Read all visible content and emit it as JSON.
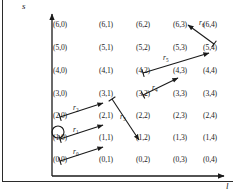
{
  "figure": {
    "name": "state-lattice-transition-diagram",
    "background": "#ffffff",
    "ink": "#1a1a1a",
    "width": 235,
    "height": 196
  },
  "axes": {
    "y_label": "s",
    "x_label": "l",
    "y_axis": {
      "x": 52,
      "y_top": 14,
      "y_bottom": 176,
      "arrow": "up"
    },
    "x_axis": {
      "y": 176,
      "x_left": 52,
      "x_right": 224,
      "arrow": "right"
    }
  },
  "chart_data": {
    "type": "scatter",
    "title": "",
    "xlabel": "l",
    "ylabel": "s",
    "grid": false,
    "legend": "none",
    "x_values": [
      0,
      1,
      2,
      3,
      4
    ],
    "y_values": [
      0,
      1,
      2,
      3,
      4,
      5,
      6
    ],
    "column_x_px": [
      62,
      108,
      145,
      182,
      212
    ],
    "row_y_px": [
      160,
      138,
      116,
      94,
      71,
      48,
      25
    ],
    "nodes": [
      {
        "s": 6,
        "l": 0,
        "label": "(6,0)"
      },
      {
        "s": 6,
        "l": 1,
        "label": "(6,1)"
      },
      {
        "s": 6,
        "l": 2,
        "label": "(6,2)"
      },
      {
        "s": 6,
        "l": 3,
        "label": "(6,3)"
      },
      {
        "s": 6,
        "l": 4,
        "label": "(6,4)"
      },
      {
        "s": 5,
        "l": 0,
        "label": "(5,0)"
      },
      {
        "s": 5,
        "l": 1,
        "label": "(5,1)"
      },
      {
        "s": 5,
        "l": 2,
        "label": "(5,2)"
      },
      {
        "s": 5,
        "l": 3,
        "label": "(5,3)"
      },
      {
        "s": 5,
        "l": 4,
        "label": "(5,4)"
      },
      {
        "s": 4,
        "l": 0,
        "label": "(4,0)"
      },
      {
        "s": 4,
        "l": 1,
        "label": "(4,1)"
      },
      {
        "s": 4,
        "l": 2,
        "label": "(4,2)"
      },
      {
        "s": 4,
        "l": 3,
        "label": "(4,3)"
      },
      {
        "s": 4,
        "l": 4,
        "label": "(4,4)"
      },
      {
        "s": 3,
        "l": 0,
        "label": "(3,0)"
      },
      {
        "s": 3,
        "l": 1,
        "label": "(3,1)"
      },
      {
        "s": 3,
        "l": 2,
        "label": "(3,2)"
      },
      {
        "s": 3,
        "l": 3,
        "label": "(3,3)"
      },
      {
        "s": 3,
        "l": 4,
        "label": "(3,4)"
      },
      {
        "s": 2,
        "l": 0,
        "label": "(2,0)"
      },
      {
        "s": 2,
        "l": 1,
        "label": "(2,1)"
      },
      {
        "s": 2,
        "l": 2,
        "label": "(2,2)"
      },
      {
        "s": 2,
        "l": 3,
        "label": "(2,3)"
      },
      {
        "s": 2,
        "l": 4,
        "label": "(2,4)"
      },
      {
        "s": 1,
        "l": 0,
        "label": "(1,0)"
      },
      {
        "s": 1,
        "l": 1,
        "label": "(1,1)"
      },
      {
        "s": 1,
        "l": 2,
        "label": "(1,2)"
      },
      {
        "s": 1,
        "l": 3,
        "label": "(1,3)"
      },
      {
        "s": 1,
        "l": 4,
        "label": "(1,4)"
      },
      {
        "s": 0,
        "l": 0,
        "label": "(0,0)"
      },
      {
        "s": 0,
        "l": 1,
        "label": "(0,1)"
      },
      {
        "s": 0,
        "l": 2,
        "label": "(0,2)"
      },
      {
        "s": 0,
        "l": 3,
        "label": "(0,3)"
      },
      {
        "s": 0,
        "l": 4,
        "label": "(0,4)"
      }
    ],
    "arrows": [
      {
        "id": "r0",
        "label": "r",
        "subscript": "0",
        "from": "(0,0)",
        "to": "(1,1)",
        "x1": 60,
        "y1": 161,
        "x2": 103,
        "y2": 147,
        "label_x": 73,
        "label_y": 148
      },
      {
        "id": "r1",
        "label": "r",
        "subscript": "1",
        "from": "(1,0)",
        "to": "(2,1)",
        "x1": 60,
        "y1": 139,
        "x2": 103,
        "y2": 125,
        "label_x": 73,
        "label_y": 126
      },
      {
        "id": "r2",
        "label": "r",
        "subscript": "2",
        "from": "(2,0)",
        "to": "(3,1)",
        "x1": 60,
        "y1": 117,
        "x2": 103,
        "y2": 103,
        "label_x": 73,
        "label_y": 104
      },
      {
        "id": "r3",
        "label": "r",
        "subscript": "3",
        "from": "(3,1)",
        "to": "(1,2)",
        "x1": 112,
        "y1": 99,
        "x2": 139,
        "y2": 140,
        "label_x": 120,
        "label_y": 113
      },
      {
        "id": "r4",
        "label": "r",
        "subscript": "4",
        "from": "(3,2)",
        "to": "(4,3)",
        "x1": 143,
        "y1": 95,
        "x2": 178,
        "y2": 78,
        "label_x": 152,
        "label_y": 84
      },
      {
        "id": "r5",
        "label": "r",
        "subscript": "5",
        "from": "(4,2)",
        "to": "(5,4)",
        "x1": 143,
        "y1": 73,
        "x2": 209,
        "y2": 53,
        "label_x": 163,
        "label_y": 54
      },
      {
        "id": "r6",
        "label": "r",
        "subscript": "6",
        "from": "(5,4)",
        "to": "(6,3)",
        "x1": 214,
        "y1": 44,
        "x2": 188,
        "y2": 25,
        "label_x": 199,
        "label_y": 19
      }
    ],
    "markers": [
      {
        "id": "start-marker",
        "shape": "circle",
        "near": "(1,0)",
        "cx": 58,
        "cy": 132,
        "r": 6
      }
    ]
  }
}
